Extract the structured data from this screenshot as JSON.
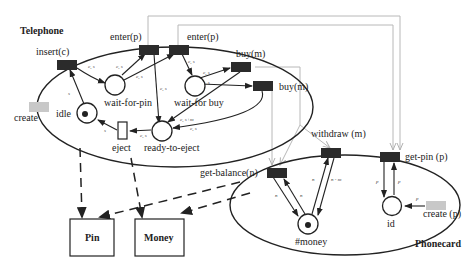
{
  "diagram": {
    "components": {
      "telephone": "Telephone",
      "phonecard": "Phonecard"
    },
    "telephone": {
      "transitions": {
        "insert": "insert(c)",
        "enter1": "enter(p)",
        "enter2": "enter(p)",
        "buy1": "buy(m)",
        "buy2": "buy(m)",
        "eject": "eject",
        "create": "create"
      },
      "places": {
        "idle": "idle",
        "wait_for_pin": "wait-for-pin",
        "wait_for_buy": "wait-for buy",
        "ready_to_eject": "ready-to-eject"
      }
    },
    "phonecard": {
      "transitions": {
        "get_balance": "get-balance(n)",
        "withdraw": "withdraw (m)",
        "get_pin": "get-pin (p)",
        "create": "create (p)"
      },
      "places": {
        "money": "#money",
        "id": "id"
      }
    },
    "modules": {
      "pin": "Pin",
      "money": "Money"
    },
    "arc_labels": {
      "cs": "c, s",
      "s": "s",
      "csm": "c, s+m",
      "n": "n",
      "nm": "n - m",
      "p": "p"
    },
    "colors": {
      "transition": "#2b2b2b",
      "stub": "#c8c8c8",
      "grey_link": "#b8b8b8"
    }
  }
}
